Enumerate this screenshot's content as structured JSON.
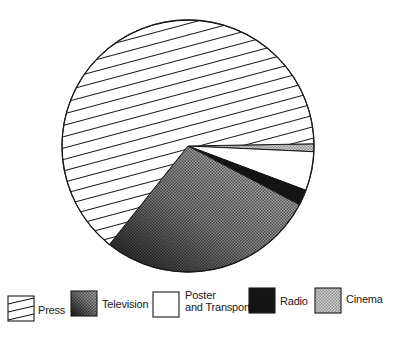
{
  "chart_data": {
    "type": "pie",
    "title": "",
    "unit": "percent",
    "start_angle_deg": -1,
    "direction": "clockwise",
    "slices": [
      {
        "label": "Cinema",
        "value": 1,
        "pattern": "dots-light"
      },
      {
        "label": "Poster and Transport",
        "value": 5,
        "pattern": "white"
      },
      {
        "label": "Radio",
        "value": 2,
        "pattern": "black"
      },
      {
        "label": "Television",
        "value": 28,
        "pattern": "dots-gradient"
      },
      {
        "label": "Press",
        "value": 64,
        "pattern": "hatch"
      }
    ],
    "legend_position": "bottom",
    "grid": false
  },
  "legend": {
    "items": [
      {
        "label_lines": [
          "Press"
        ],
        "pattern": "hatch"
      },
      {
        "label_lines": [
          "Television"
        ],
        "pattern": "dots-gradient"
      },
      {
        "label_lines": [
          "Poster",
          "and Transport"
        ],
        "pattern": "white"
      },
      {
        "label_lines": [
          "Radio"
        ],
        "pattern": "black"
      },
      {
        "label_lines": [
          "Cinema"
        ],
        "pattern": "dots-light"
      }
    ]
  },
  "colors": {
    "ink": "#1a1a1a",
    "black_fill": "#141414",
    "light_dots": "#b5b5b5",
    "tv_dark": "#2a2a2a",
    "tv_light": "#c8c8c8"
  }
}
